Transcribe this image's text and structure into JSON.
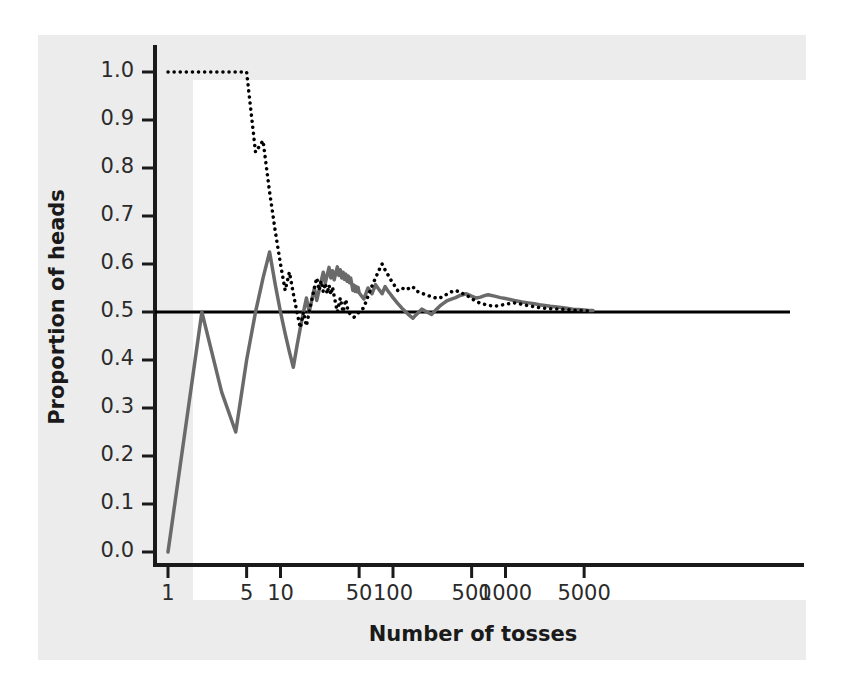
{
  "chart_data": {
    "type": "line",
    "title": "",
    "xlabel": "Number of tosses",
    "ylabel": "Proportion of heads",
    "xscale": "log",
    "xlim": [
      1,
      6500
    ],
    "ylim": [
      -0.02,
      1.04
    ],
    "grid": false,
    "legend": "none",
    "xticks": [
      1,
      5,
      10,
      50,
      100,
      500,
      1000,
      5000
    ],
    "xtick_labels": [
      "1",
      "5",
      "10",
      "50",
      "100",
      "500",
      "1000",
      "5000"
    ],
    "yticks": [
      0.0,
      0.1,
      0.2,
      0.3,
      0.4,
      0.5,
      0.6,
      0.7,
      0.8,
      0.9,
      1.0
    ],
    "ytick_labels": [
      "0.0",
      "0.1",
      "0.2",
      "0.3",
      "0.4",
      "0.5",
      "0.6",
      "0.7",
      "0.8",
      "0.9",
      "1.0"
    ],
    "reference_line": {
      "name": "probability-0.5-line",
      "y": 0.5,
      "color": "#000000",
      "width": 3,
      "style": "solid"
    },
    "series": [
      {
        "name": "Trial 1",
        "style": "solid",
        "color": "#6a6a6a",
        "width": 3.5,
        "points": [
          [
            1,
            0.0
          ],
          [
            2,
            0.5
          ],
          [
            3,
            0.333
          ],
          [
            4,
            0.25
          ],
          [
            5,
            0.4
          ],
          [
            6,
            0.5
          ],
          [
            7,
            0.571
          ],
          [
            8,
            0.625
          ],
          [
            9,
            0.556
          ],
          [
            10,
            0.5
          ],
          [
            11,
            0.455
          ],
          [
            12,
            0.417
          ],
          [
            13,
            0.385
          ],
          [
            14,
            0.429
          ],
          [
            15,
            0.467
          ],
          [
            16,
            0.5
          ],
          [
            17,
            0.529
          ],
          [
            18,
            0.5
          ],
          [
            19,
            0.526
          ],
          [
            20,
            0.55
          ],
          [
            21,
            0.524
          ],
          [
            22,
            0.545
          ],
          [
            23,
            0.565
          ],
          [
            24,
            0.583
          ],
          [
            25,
            0.56
          ],
          [
            26,
            0.577
          ],
          [
            27,
            0.593
          ],
          [
            28,
            0.571
          ],
          [
            29,
            0.586
          ],
          [
            30,
            0.567
          ],
          [
            31,
            0.581
          ],
          [
            32,
            0.594
          ],
          [
            33,
            0.576
          ],
          [
            34,
            0.588
          ],
          [
            35,
            0.571
          ],
          [
            36,
            0.583
          ],
          [
            37,
            0.568
          ],
          [
            38,
            0.579
          ],
          [
            39,
            0.564
          ],
          [
            40,
            0.575
          ],
          [
            41,
            0.561
          ],
          [
            42,
            0.571
          ],
          [
            43,
            0.558
          ],
          [
            44,
            0.545
          ],
          [
            45,
            0.556
          ],
          [
            46,
            0.543
          ],
          [
            47,
            0.553
          ],
          [
            48,
            0.542
          ],
          [
            49,
            0.551
          ],
          [
            50,
            0.54
          ],
          [
            55,
            0.527
          ],
          [
            60,
            0.55
          ],
          [
            65,
            0.538
          ],
          [
            70,
            0.557
          ],
          [
            75,
            0.547
          ],
          [
            80,
            0.538
          ],
          [
            85,
            0.553
          ],
          [
            90,
            0.544
          ],
          [
            95,
            0.537
          ],
          [
            100,
            0.53
          ],
          [
            110,
            0.518
          ],
          [
            120,
            0.508
          ],
          [
            130,
            0.5
          ],
          [
            140,
            0.493
          ],
          [
            150,
            0.487
          ],
          [
            160,
            0.494
          ],
          [
            170,
            0.5
          ],
          [
            180,
            0.506
          ],
          [
            200,
            0.5
          ],
          [
            220,
            0.495
          ],
          [
            240,
            0.504
          ],
          [
            260,
            0.512
          ],
          [
            280,
            0.518
          ],
          [
            300,
            0.523
          ],
          [
            330,
            0.527
          ],
          [
            360,
            0.53
          ],
          [
            400,
            0.535
          ],
          [
            450,
            0.538
          ],
          [
            500,
            0.533
          ],
          [
            550,
            0.529
          ],
          [
            600,
            0.531
          ],
          [
            650,
            0.534
          ],
          [
            700,
            0.536
          ],
          [
            800,
            0.533
          ],
          [
            900,
            0.53
          ],
          [
            1000,
            0.528
          ],
          [
            1200,
            0.524
          ],
          [
            1400,
            0.521
          ],
          [
            1600,
            0.519
          ],
          [
            1800,
            0.517
          ],
          [
            2000,
            0.515
          ],
          [
            2500,
            0.512
          ],
          [
            3000,
            0.51
          ],
          [
            3500,
            0.508
          ],
          [
            4000,
            0.506
          ],
          [
            4500,
            0.505
          ],
          [
            5000,
            0.504
          ],
          [
            5500,
            0.503
          ],
          [
            6000,
            0.503
          ]
        ]
      },
      {
        "name": "Trial 2",
        "style": "dotted",
        "color": "#000000",
        "width": 3.5,
        "points": [
          [
            1,
            1.0
          ],
          [
            2,
            1.0
          ],
          [
            3,
            1.0
          ],
          [
            4,
            1.0
          ],
          [
            5,
            1.0
          ],
          [
            6,
            0.833
          ],
          [
            7,
            0.857
          ],
          [
            8,
            0.75
          ],
          [
            9,
            0.667
          ],
          [
            10,
            0.6
          ],
          [
            11,
            0.545
          ],
          [
            12,
            0.583
          ],
          [
            13,
            0.538
          ],
          [
            14,
            0.5
          ],
          [
            15,
            0.467
          ],
          [
            16,
            0.5
          ],
          [
            17,
            0.471
          ],
          [
            18,
            0.5
          ],
          [
            19,
            0.526
          ],
          [
            20,
            0.55
          ],
          [
            21,
            0.571
          ],
          [
            22,
            0.545
          ],
          [
            23,
            0.565
          ],
          [
            24,
            0.542
          ],
          [
            25,
            0.56
          ],
          [
            26,
            0.538
          ],
          [
            27,
            0.556
          ],
          [
            28,
            0.536
          ],
          [
            29,
            0.552
          ],
          [
            30,
            0.533
          ],
          [
            32,
            0.5
          ],
          [
            34,
            0.529
          ],
          [
            36,
            0.5
          ],
          [
            38,
            0.526
          ],
          [
            40,
            0.5
          ],
          [
            45,
            0.489
          ],
          [
            50,
            0.5
          ],
          [
            55,
            0.509
          ],
          [
            60,
            0.533
          ],
          [
            65,
            0.554
          ],
          [
            70,
            0.571
          ],
          [
            75,
            0.587
          ],
          [
            80,
            0.6
          ],
          [
            85,
            0.588
          ],
          [
            90,
            0.578
          ],
          [
            95,
            0.568
          ],
          [
            100,
            0.56
          ],
          [
            110,
            0.545
          ],
          [
            120,
            0.55
          ],
          [
            130,
            0.546
          ],
          [
            140,
            0.55
          ],
          [
            150,
            0.553
          ],
          [
            160,
            0.544
          ],
          [
            180,
            0.539
          ],
          [
            200,
            0.535
          ],
          [
            220,
            0.532
          ],
          [
            250,
            0.528
          ],
          [
            280,
            0.532
          ],
          [
            300,
            0.537
          ],
          [
            330,
            0.542
          ],
          [
            360,
            0.545
          ],
          [
            400,
            0.54
          ],
          [
            450,
            0.535
          ],
          [
            500,
            0.528
          ],
          [
            550,
            0.522
          ],
          [
            600,
            0.518
          ],
          [
            700,
            0.514
          ],
          [
            800,
            0.512
          ],
          [
            900,
            0.514
          ],
          [
            1000,
            0.516
          ],
          [
            1200,
            0.519
          ],
          [
            1400,
            0.516
          ],
          [
            1600,
            0.513
          ],
          [
            1800,
            0.511
          ],
          [
            2000,
            0.509
          ],
          [
            2500,
            0.507
          ],
          [
            3000,
            0.506
          ],
          [
            3500,
            0.505
          ],
          [
            4000,
            0.504
          ],
          [
            4500,
            0.503
          ],
          [
            5000,
            0.503
          ],
          [
            5500,
            0.502
          ],
          [
            6000,
            0.502
          ]
        ]
      }
    ]
  }
}
